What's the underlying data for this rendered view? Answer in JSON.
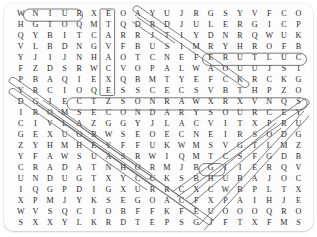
{
  "puzzle": {
    "type": "word-search",
    "rows": 20,
    "cols": 20,
    "grid": [
      [
        "W",
        "N",
        "I",
        "U",
        "R",
        "X",
        "E",
        "O",
        "A",
        "Y",
        "U",
        "J",
        "R",
        "G",
        "S",
        "Y",
        "V",
        "F",
        "C",
        "O"
      ],
      [
        "H",
        "G",
        "T",
        "O",
        "Q",
        "M",
        "T",
        "Q",
        "D",
        "R",
        "D",
        "J",
        "U",
        "L",
        "E",
        "R",
        "G",
        "I",
        "C",
        "P"
      ],
      [
        "Q",
        "Y",
        "B",
        "I",
        "T",
        "C",
        "A",
        "R",
        "R",
        "J",
        "T",
        "I",
        "Y",
        "D",
        "N",
        "R",
        "Q",
        "W",
        "U",
        "K"
      ],
      [
        "V",
        "L",
        "B",
        "D",
        "N",
        "G",
        "V",
        "F",
        "B",
        "U",
        "S",
        "I",
        "M",
        "R",
        "Y",
        "H",
        "R",
        "O",
        "F",
        "B"
      ],
      [
        "Y",
        "J",
        "I",
        "J",
        "N",
        "H",
        "A",
        "O",
        "T",
        "C",
        "N",
        "E",
        "F",
        "E",
        "R",
        "U",
        "T",
        "L",
        "U",
        "C"
      ],
      [
        "F",
        "Z",
        "D",
        "S",
        "R",
        "W",
        "C",
        "V",
        "O",
        "P",
        "A",
        "L",
        "W",
        "A",
        "O",
        "U",
        "U",
        "J",
        "S",
        "I"
      ],
      [
        "P",
        "B",
        "A",
        "Q",
        "I",
        "E",
        "X",
        "Q",
        "B",
        "M",
        "T",
        "Y",
        "E",
        "F",
        "C",
        "K",
        "R",
        "C",
        "K",
        "G"
      ],
      [
        "Y",
        "R",
        "C",
        "I",
        "O",
        "Q",
        "E",
        "S",
        "S",
        "C",
        "E",
        "C",
        "S",
        "V",
        "B",
        "T",
        "H",
        "P",
        "Z",
        "O"
      ],
      [
        "D",
        "G",
        "I",
        "E",
        "C",
        "T",
        "Z",
        "S",
        "O",
        "N",
        "R",
        "A",
        "W",
        "X",
        "R",
        "X",
        "V",
        "N",
        "Q",
        "S"
      ],
      [
        "I",
        "R",
        "O",
        "M",
        "S",
        "E",
        "C",
        "O",
        "N",
        "D",
        "A",
        "R",
        "Y",
        "S",
        "O",
        "U",
        "R",
        "C",
        "E",
        "Y"
      ],
      [
        "C",
        "I",
        "V",
        "L",
        "A",
        "Z",
        "G",
        "G",
        "Y",
        "J",
        "L",
        "A",
        "C",
        "V",
        "I",
        "T",
        "X",
        "P",
        "R",
        "U"
      ],
      [
        "G",
        "E",
        "X",
        "U",
        "O",
        "R",
        "W",
        "S",
        "E",
        "O",
        "E",
        "C",
        "N",
        "E",
        "I",
        "R",
        "S",
        "O",
        "D",
        "G"
      ],
      [
        "Z",
        "Y",
        "H",
        "M",
        "H",
        "E",
        "Y",
        "F",
        "F",
        "U",
        "K",
        "W",
        "M",
        "S",
        "V",
        "G",
        "T",
        "L",
        "M",
        "Z"
      ],
      [
        "Y",
        "F",
        "A",
        "W",
        "S",
        "U",
        "A",
        "S",
        "R",
        "W",
        "I",
        "Q",
        "M",
        "T",
        "C",
        "S",
        "F",
        "G",
        "D",
        "B"
      ],
      [
        "C",
        "R",
        "A",
        "D",
        "A",
        "T",
        "N",
        "H",
        "O",
        "R",
        "M",
        "J",
        "B",
        "G",
        "I",
        "I",
        "E",
        "R",
        "Q",
        "V"
      ],
      [
        "U",
        "N",
        "D",
        "U",
        "G",
        "T",
        "X",
        "Y",
        "C",
        "U",
        "K",
        "S",
        "B",
        "H",
        "U",
        "B",
        "A",
        "J",
        "O",
        "C"
      ],
      [
        "I",
        "Q",
        "G",
        "P",
        "D",
        "I",
        "G",
        "X",
        "U",
        "R",
        "R",
        "C",
        "X",
        "C",
        "W",
        "B",
        "P",
        "L",
        "T",
        "X"
      ],
      [
        "X",
        "P",
        "M",
        "J",
        "Y",
        "K",
        "S",
        "E",
        "G",
        "O",
        "A",
        "C",
        "F",
        "X",
        "P",
        "A",
        "I",
        "H",
        "J",
        "E"
      ],
      [
        "W",
        "V",
        "S",
        "Q",
        "C",
        "I",
        "O",
        "B",
        "F",
        "F",
        "K",
        "F",
        "E",
        "U",
        "O",
        "O",
        "O",
        "Q",
        "R",
        "O"
      ],
      [
        "S",
        "X",
        "X",
        "Y",
        "L",
        "K",
        "R",
        "D",
        "T",
        "E",
        "P",
        "S",
        "G",
        "J",
        "F",
        "T",
        "X",
        "F",
        "M",
        "S"
      ]
    ],
    "found_words": [
      {
        "word": "NIUR",
        "reads": "RUIN",
        "orientation": "horizontal-reverse",
        "start_row": 0,
        "start_col": 1,
        "end_row": 0,
        "end_col": 4,
        "marker": "capsule"
      },
      {
        "word": "EXCAVATE",
        "reads": "EXCAVATE",
        "orientation": "vertical-reverse",
        "start_row": 0,
        "start_col": 6,
        "end_row": 7,
        "end_col": 6,
        "marker": "capsule"
      },
      {
        "word": "ERUTLUC",
        "reads": "CULTURE",
        "orientation": "horizontal-reverse",
        "start_row": 4,
        "start_col": 13,
        "end_row": 4,
        "end_col": 19,
        "marker": "capsule"
      },
      {
        "word": "SECONDARYSOURCE",
        "reads": "SECONDARY SOURCE",
        "orientation": "horizontal",
        "start_row": 9,
        "start_col": 4,
        "end_row": 9,
        "end_col": 19,
        "marker": "capsule"
      },
      {
        "word": "ARTIFACT",
        "orientation": "diagonal-down-right",
        "start_row": 0,
        "start_col": 8,
        "end_row": 7,
        "end_col": 15,
        "marker": "diagonal"
      },
      {
        "word": "DIG",
        "orientation": "diagonal-down-right",
        "start_row": 1,
        "start_col": 8,
        "end_row": 3,
        "end_col": 10,
        "marker": "diagonal"
      },
      {
        "word": "PREHISTORY",
        "orientation": "diagonal-down-right",
        "start_row": 6,
        "start_col": 0,
        "end_row": 15,
        "end_col": 9,
        "marker": "diagonal"
      },
      {
        "word": "YEARS",
        "orientation": "diagonal-down-right",
        "start_row": 7,
        "start_col": 0,
        "end_row": 16,
        "end_col": 9,
        "marker": "diagonal"
      },
      {
        "word": "ARCHAEOLOGY",
        "orientation": "diagonal-down-right",
        "start_row": 8,
        "start_col": 2,
        "end_row": 18,
        "end_col": 12,
        "marker": "diagonal"
      },
      {
        "word": "EVIDENCE",
        "orientation": "diagonal-down-right",
        "start_row": 9,
        "start_col": 3,
        "end_row": 19,
        "end_col": 13,
        "marker": "diagonal"
      },
      {
        "word": "HUB",
        "orientation": "horizontal",
        "start_row": 15,
        "start_col": 13,
        "end_row": 15,
        "end_col": 15,
        "marker": "capsule-small"
      },
      {
        "word": "YDIAGONAL",
        "orientation": "diagonal-down-left",
        "start_row": 9,
        "start_col": 19,
        "end_row": 18,
        "end_col": 10,
        "marker": "diagonal-left"
      },
      {
        "word": "DIAGONAL2",
        "orientation": "diagonal-down-left",
        "start_row": 10,
        "start_col": 19,
        "end_row": 19,
        "end_col": 12,
        "marker": "diagonal-left"
      },
      {
        "word": "SHORTDIAG",
        "orientation": "diagonal-down-left",
        "start_row": 11,
        "start_col": 17,
        "end_row": 17,
        "end_col": 11,
        "marker": "diagonal-left"
      }
    ]
  },
  "colors": {
    "page_background": "#ffffff",
    "card_background": "#fdfdfd",
    "letter": "#2a2a2a",
    "marker_stroke": "#6a6a6a"
  }
}
